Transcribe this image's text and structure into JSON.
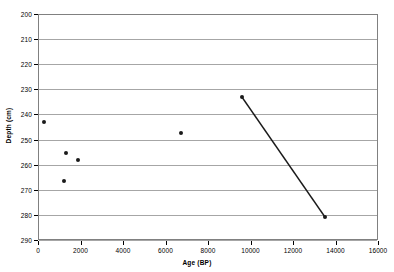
{
  "chart_data": {
    "type": "scatter",
    "title": "",
    "xlabel": "Age (BP)",
    "ylabel": "Depth  (cm)",
    "xlim": [
      0,
      16000
    ],
    "ylim": [
      200,
      290
    ],
    "y_inverted": true,
    "grid": "horizontal",
    "legend": "none",
    "xticks": [
      0,
      2000,
      4000,
      6000,
      8000,
      10000,
      12000,
      14000,
      16000
    ],
    "xtick_labels": [
      "0",
      "2000",
      "4000",
      "6000",
      "8000",
      "10000",
      "12000",
      "14000",
      "16000"
    ],
    "yticks": [
      200,
      210,
      220,
      230,
      240,
      250,
      260,
      270,
      280,
      290
    ],
    "ytick_labels": [
      "200",
      "210",
      "220",
      "230",
      "240",
      "250",
      "260",
      "270",
      "280",
      "290"
    ],
    "series": [
      {
        "name": "scatter-points",
        "marker": "filled-circle",
        "color": "#1a1a1a",
        "points": [
          {
            "x": 280,
            "y": 243.0
          },
          {
            "x": 1320,
            "y": 255.4
          },
          {
            "x": 1880,
            "y": 258.1
          },
          {
            "x": 1225,
            "y": 266.5
          },
          {
            "x": 6730,
            "y": 247.4
          },
          {
            "x": 9600,
            "y": 233.1
          },
          {
            "x": 13500,
            "y": 280.8
          }
        ]
      },
      {
        "name": "connecting-line",
        "color": "#1a1a1a",
        "points": [
          {
            "x": 9600,
            "y": 233.1
          },
          {
            "x": 13500,
            "y": 280.8
          }
        ]
      }
    ]
  }
}
